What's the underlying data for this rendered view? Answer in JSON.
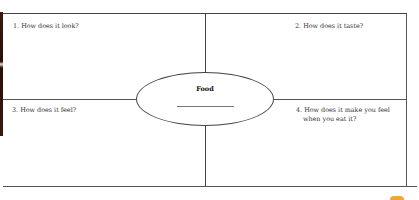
{
  "worksheet": {
    "center_label": "Food",
    "quadrants": [
      {
        "id": 1,
        "label": "1. How does it look?"
      },
      {
        "id": 2,
        "label": "2. How does it taste?"
      },
      {
        "id": 3,
        "label": "3. How does it feel?"
      },
      {
        "id": 4,
        "label_line1": "4. How does it make you feel",
        "label_line2": "when you eat it?"
      }
    ]
  },
  "colors": {
    "lines": "#444444",
    "badge": "#f3a531"
  }
}
